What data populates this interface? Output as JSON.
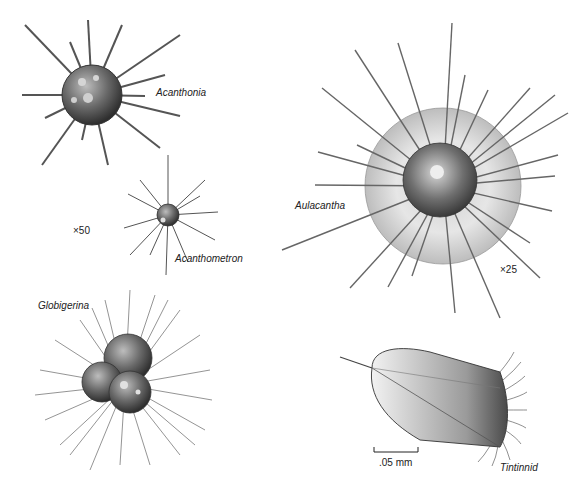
{
  "figure": {
    "specimens": [
      {
        "id": "acanthonia",
        "label": "Acanthonia"
      },
      {
        "id": "acanthometron",
        "label": "Acanthometron"
      },
      {
        "id": "globigerina",
        "label": "Globigerina"
      },
      {
        "id": "aulacantha",
        "label": "Aulacantha"
      },
      {
        "id": "tintinnid",
        "label": "Tintinnid"
      }
    ],
    "magnifications": {
      "left": "×50",
      "right": "×25"
    },
    "scale_bar": {
      "label": ".05 mm"
    }
  }
}
